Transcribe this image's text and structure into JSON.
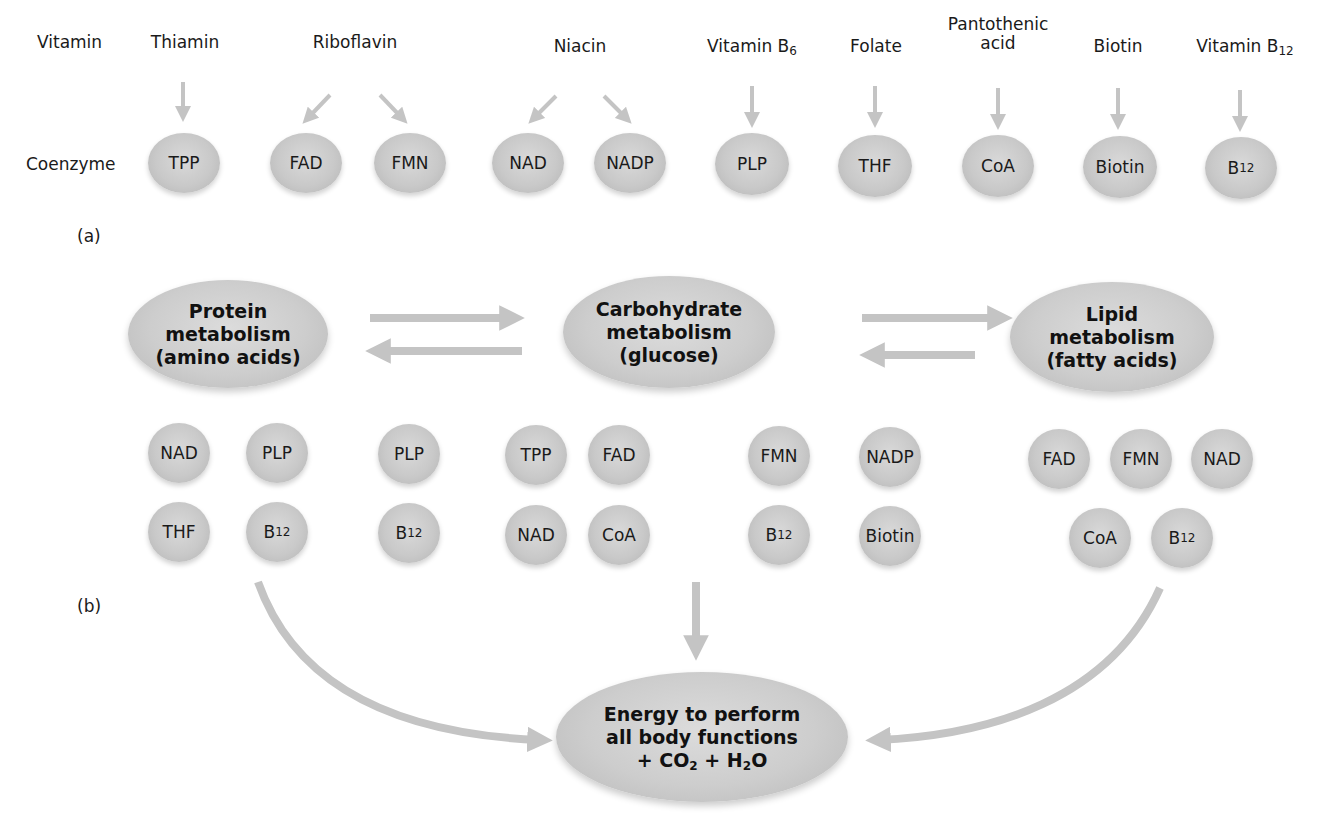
{
  "panel_a": {
    "tag": "(a)",
    "row_label_vitamin": "Vitamin",
    "row_label_coenzyme": "Coenzyme",
    "vitamins": [
      {
        "name": "Thiamin",
        "coenzymes": [
          "TPP"
        ]
      },
      {
        "name": "Riboflavin",
        "coenzymes": [
          "FAD",
          "FMN"
        ]
      },
      {
        "name": "Niacin",
        "coenzymes": [
          "NAD",
          "NADP"
        ]
      },
      {
        "name": "Vitamin B",
        "subscript": "6",
        "coenzymes": [
          "PLP"
        ]
      },
      {
        "name": "Folate",
        "coenzymes": [
          "THF"
        ]
      },
      {
        "name_line1": "Pantothenic",
        "name_line2": "acid",
        "coenzymes": [
          "CoA"
        ]
      },
      {
        "name": "Biotin",
        "coenzymes": [
          "Biotin"
        ]
      },
      {
        "name": "Vitamin B",
        "subscript": "12",
        "coenzymes": [
          "B12"
        ]
      }
    ],
    "coenzymes": [
      "TPP",
      "FAD",
      "FMN",
      "NAD",
      "NADP",
      "PLP",
      "THF",
      "CoA",
      "Biotin",
      "B12"
    ],
    "b12_base": "B",
    "b12_sub": "12"
  },
  "panel_b": {
    "tag": "(b)",
    "protein": {
      "line1": "Protein",
      "line2": "metabolism",
      "line3": "(amino acids)"
    },
    "carbohydrate": {
      "line1": "Carbohydrate",
      "line2": "metabolism",
      "line3": "(glucose)"
    },
    "lipid": {
      "line1": "Lipid",
      "line2": "metabolism",
      "line3": "(fatty acids)"
    },
    "energy": {
      "line1": "Energy to perform",
      "line2": "all body functions",
      "line3_prefix": "+ CO",
      "co2_sub": "2",
      "line3_mid": " + H",
      "h2o_sub": "2",
      "line3_suffix": "O"
    },
    "protein_coenzymes": [
      "NAD",
      "PLP",
      "THF",
      "B12"
    ],
    "protein_carb_shared": [
      "PLP",
      "B12"
    ],
    "carbohydrate_coenzymes": [
      "TPP",
      "FAD",
      "FMN",
      "NAD",
      "CoA",
      "B12"
    ],
    "carb_lipid_shared": [
      "NADP",
      "Biotin"
    ],
    "lipid_coenzymes": [
      "FAD",
      "FMN",
      "NAD",
      "CoA",
      "B12"
    ]
  },
  "colors": {
    "arrow": "#c4c4c4",
    "coin": "#c9c9c9",
    "text": "#1a1a1a",
    "background": "#ffffff"
  }
}
